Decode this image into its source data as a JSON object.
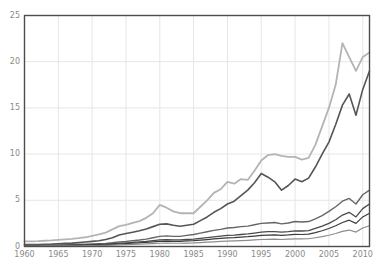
{
  "chart_data": {
    "type": "line",
    "title": "",
    "subtitle": "",
    "xlabel": "",
    "ylabel": "",
    "xlim": [
      1960,
      2011
    ],
    "ylim": [
      0,
      25
    ],
    "grid": true,
    "legend": "none",
    "background": "#ffffff",
    "axis_color": "#4d4d4d",
    "grid_color": "#e6e6e6",
    "tick_label_color": "#8a8a8a",
    "xticks": [
      1960,
      1965,
      1970,
      1975,
      1980,
      1985,
      1990,
      1995,
      2000,
      2005,
      2010
    ],
    "yticks": [
      0,
      5,
      10,
      15,
      20,
      25
    ],
    "x": [
      1960,
      1961,
      1962,
      1963,
      1964,
      1965,
      1966,
      1967,
      1968,
      1969,
      1970,
      1971,
      1972,
      1973,
      1974,
      1975,
      1976,
      1977,
      1978,
      1979,
      1980,
      1981,
      1982,
      1983,
      1984,
      1985,
      1986,
      1987,
      1988,
      1989,
      1990,
      1991,
      1992,
      1993,
      1994,
      1995,
      1996,
      1997,
      1998,
      1999,
      2000,
      2001,
      2002,
      2003,
      2004,
      2005,
      2006,
      2007,
      2008,
      2009,
      2010,
      2011
    ],
    "series": [
      {
        "name": "series-1",
        "color": "#b4b4b4",
        "width": 1.8,
        "values": [
          0.55,
          0.56,
          0.58,
          0.62,
          0.66,
          0.72,
          0.78,
          0.82,
          0.9,
          1.0,
          1.15,
          1.3,
          1.5,
          1.85,
          2.2,
          2.35,
          2.55,
          2.75,
          3.1,
          3.6,
          4.5,
          4.2,
          3.8,
          3.6,
          3.6,
          3.6,
          4.3,
          5.0,
          5.8,
          6.2,
          7.0,
          6.8,
          7.3,
          7.2,
          8.2,
          9.3,
          9.9,
          10.0,
          9.8,
          9.7,
          9.7,
          9.4,
          9.6,
          11.0,
          13.0,
          15.0,
          17.5,
          22.0,
          20.5,
          19.0,
          20.5,
          21.0
        ]
      },
      {
        "name": "series-2",
        "color": "#555555",
        "width": 1.6,
        "values": [
          0.2,
          0.21,
          0.22,
          0.24,
          0.26,
          0.3,
          0.34,
          0.37,
          0.42,
          0.48,
          0.55,
          0.63,
          0.75,
          0.95,
          1.25,
          1.4,
          1.55,
          1.7,
          1.9,
          2.15,
          2.4,
          2.45,
          2.3,
          2.2,
          2.3,
          2.4,
          2.8,
          3.2,
          3.7,
          4.1,
          4.6,
          4.9,
          5.5,
          6.1,
          6.9,
          7.9,
          7.5,
          7.0,
          6.1,
          6.6,
          7.3,
          7.0,
          7.4,
          8.6,
          10.0,
          11.3,
          13.2,
          15.3,
          16.5,
          14.2,
          17.0,
          19.0
        ]
      },
      {
        "name": "series-3",
        "color": "#666666",
        "width": 1.4,
        "values": [
          0.12,
          0.12,
          0.13,
          0.14,
          0.15,
          0.16,
          0.18,
          0.19,
          0.21,
          0.24,
          0.27,
          0.3,
          0.34,
          0.4,
          0.5,
          0.55,
          0.62,
          0.7,
          0.8,
          0.95,
          1.1,
          1.15,
          1.1,
          1.1,
          1.2,
          1.3,
          1.45,
          1.6,
          1.75,
          1.85,
          2.0,
          2.05,
          2.15,
          2.2,
          2.35,
          2.5,
          2.55,
          2.6,
          2.45,
          2.55,
          2.7,
          2.65,
          2.7,
          3.0,
          3.35,
          3.8,
          4.3,
          4.9,
          5.2,
          4.6,
          5.6,
          6.1
        ]
      },
      {
        "name": "series-4",
        "color": "#4a4a4a",
        "width": 1.3,
        "values": [
          0.1,
          0.1,
          0.11,
          0.11,
          0.12,
          0.13,
          0.14,
          0.15,
          0.16,
          0.18,
          0.2,
          0.22,
          0.25,
          0.3,
          0.36,
          0.4,
          0.44,
          0.5,
          0.56,
          0.64,
          0.72,
          0.74,
          0.72,
          0.72,
          0.76,
          0.8,
          0.88,
          0.96,
          1.05,
          1.12,
          1.2,
          1.24,
          1.3,
          1.36,
          1.45,
          1.55,
          1.6,
          1.62,
          1.55,
          1.6,
          1.7,
          1.68,
          1.72,
          1.95,
          2.2,
          2.5,
          2.9,
          3.4,
          3.7,
          3.2,
          4.1,
          4.6
        ]
      },
      {
        "name": "series-5",
        "color": "#3c3c3c",
        "width": 1.2,
        "values": [
          0.08,
          0.08,
          0.085,
          0.09,
          0.095,
          0.1,
          0.11,
          0.12,
          0.13,
          0.14,
          0.16,
          0.18,
          0.2,
          0.24,
          0.29,
          0.32,
          0.35,
          0.39,
          0.44,
          0.5,
          0.56,
          0.58,
          0.56,
          0.56,
          0.6,
          0.63,
          0.69,
          0.75,
          0.82,
          0.88,
          0.94,
          0.97,
          1.02,
          1.06,
          1.13,
          1.2,
          1.24,
          1.26,
          1.2,
          1.25,
          1.32,
          1.3,
          1.34,
          1.5,
          1.7,
          1.95,
          2.25,
          2.6,
          2.85,
          2.5,
          3.2,
          3.6
        ]
      },
      {
        "name": "series-6",
        "color": "#8c8c8c",
        "width": 1.2,
        "values": [
          0.05,
          0.05,
          0.055,
          0.06,
          0.062,
          0.066,
          0.07,
          0.076,
          0.082,
          0.09,
          0.1,
          0.11,
          0.125,
          0.15,
          0.18,
          0.2,
          0.22,
          0.245,
          0.275,
          0.31,
          0.35,
          0.36,
          0.35,
          0.35,
          0.37,
          0.39,
          0.43,
          0.47,
          0.51,
          0.55,
          0.59,
          0.61,
          0.64,
          0.67,
          0.71,
          0.76,
          0.78,
          0.79,
          0.76,
          0.79,
          0.83,
          0.82,
          0.84,
          0.95,
          1.07,
          1.22,
          1.41,
          1.63,
          1.78,
          1.56,
          2.0,
          2.25
        ]
      }
    ]
  },
  "axes": {
    "ytick_labels": [
      "0",
      "5",
      "10",
      "15",
      "20",
      "25"
    ],
    "xtick_labels": [
      "1960",
      "1965",
      "1970",
      "1975",
      "1980",
      "1985",
      "1990",
      "1995",
      "2000",
      "2005",
      "2010"
    ]
  }
}
